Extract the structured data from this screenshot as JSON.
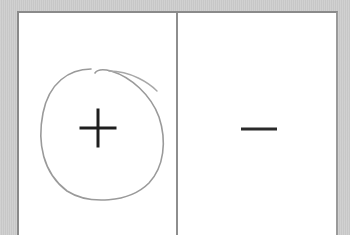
{
  "scene": {
    "background_color": "#cdcdcd",
    "board_color": "#ffffff",
    "divider_color": "#8e8e8e"
  },
  "panels": [
    {
      "position": "left",
      "symbol": "+",
      "symbol_name": "plus",
      "circled": true,
      "circle_color": "#9a9a9a"
    },
    {
      "position": "right",
      "symbol": "−",
      "symbol_name": "minus",
      "circled": false
    }
  ],
  "symbol_color": "#1e1e1e"
}
